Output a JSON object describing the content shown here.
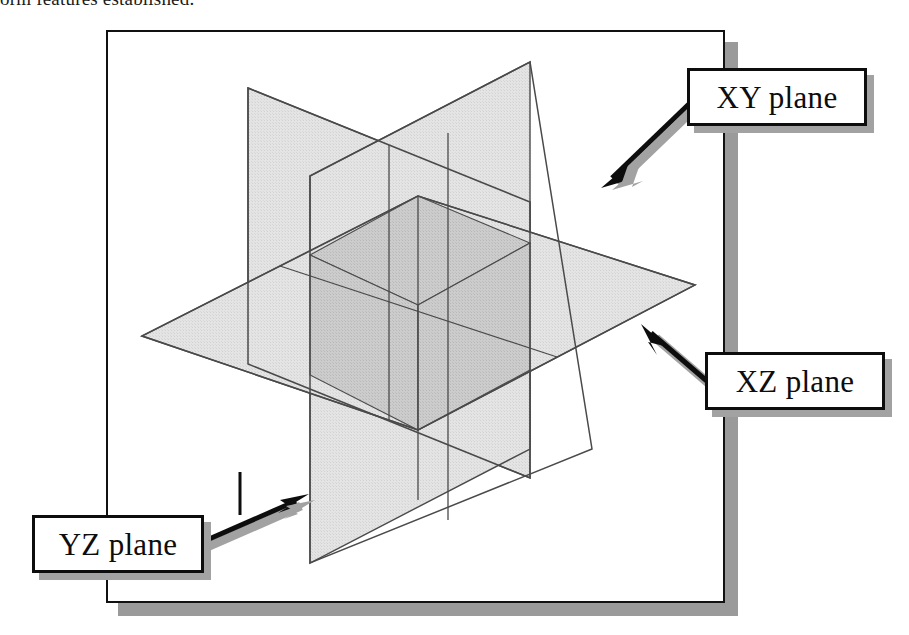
{
  "page": {
    "clipped_body_text": "orm features established.",
    "background_color": "#ffffff"
  },
  "figure": {
    "frame": {
      "border_color": "#111111",
      "shadow_color": "#9a9a9a",
      "background_color": "#ffffff"
    },
    "planes": [
      {
        "id": "xy",
        "name": "XY plane",
        "orientation": "vertical-left",
        "fill_color": "#e2e2e2",
        "edge_color": "#4a4a4a"
      },
      {
        "id": "xz",
        "name": "XZ plane",
        "orientation": "horizontal",
        "fill_color": "#e2e2e2",
        "edge_color": "#4a4a4a"
      },
      {
        "id": "yz",
        "name": "YZ plane",
        "orientation": "vertical-right",
        "fill_color": "#e2e2e2",
        "edge_color": "#4a4a4a"
      }
    ],
    "overlap_fill_color": "#c9c9c9",
    "arrow_color": "#0d0d0d",
    "arrow_shadow_color": "#a2a2a2"
  },
  "callouts": [
    {
      "id": "xy",
      "label": "XY plane",
      "box_border_color": "#0d0d0d",
      "box_fill_color": "#ffffff",
      "shadow_color": "#a2a2a2"
    },
    {
      "id": "xz",
      "label": "XZ plane",
      "box_border_color": "#0d0d0d",
      "box_fill_color": "#ffffff",
      "shadow_color": "#a2a2a2"
    },
    {
      "id": "yz",
      "label": "YZ plane",
      "box_border_color": "#0d0d0d",
      "box_fill_color": "#ffffff",
      "shadow_color": "#a2a2a2"
    }
  ]
}
